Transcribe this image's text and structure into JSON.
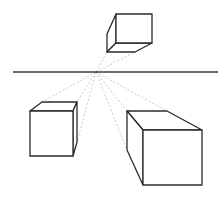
{
  "diagram": {
    "type": "one-point-perspective",
    "horizon": {
      "x1": 13,
      "x2": 218,
      "y": 72,
      "color": "#3a3a3a"
    },
    "vanishing_point": {
      "x": 96,
      "y": 72
    },
    "guide_color": "#c4c4c4",
    "edge_color": "#2b2b2b",
    "cubes": [
      {
        "name": "top-cube",
        "position": "above-horizon",
        "front_face": [
          [
            116,
            14
          ],
          [
            152,
            14
          ],
          [
            152,
            43
          ],
          [
            116,
            43
          ]
        ],
        "side_faces": [
          [
            [
              116,
              14
            ],
            [
              107,
              34
            ],
            [
              107,
              52
            ],
            [
              116,
              43
            ]
          ],
          [
            [
              116,
              43
            ],
            [
              107,
              52
            ],
            [
              135,
              52
            ],
            [
              152,
              43
            ]
          ]
        ],
        "guide_targets": [
          [
            107,
            52
          ],
          [
            135,
            52
          ]
        ]
      },
      {
        "name": "left-cube",
        "position": "below-horizon-left",
        "front_face": [
          [
            30,
            111
          ],
          [
            73,
            111
          ],
          [
            73,
            156
          ],
          [
            30,
            156
          ]
        ],
        "side_faces": [
          [
            [
              30,
              111
            ],
            [
              42,
              102
            ],
            [
              77,
              102
            ],
            [
              73,
              111
            ]
          ],
          [
            [
              73,
              111
            ],
            [
              77,
              102
            ],
            [
              77,
              142
            ],
            [
              73,
              156
            ]
          ]
        ],
        "guide_targets": [
          [
            42,
            102
          ],
          [
            77,
            102
          ],
          [
            77,
            142
          ]
        ]
      },
      {
        "name": "right-cube",
        "position": "below-horizon-right",
        "front_face": [
          [
            143,
            130
          ],
          [
            202,
            130
          ],
          [
            202,
            185
          ],
          [
            143,
            185
          ]
        ],
        "side_faces": [
          [
            [
              127,
              111
            ],
            [
              167,
              111
            ],
            [
              202,
              130
            ],
            [
              143,
              130
            ]
          ],
          [
            [
              127,
              111
            ],
            [
              143,
              130
            ],
            [
              143,
              185
            ],
            [
              127,
              150
            ]
          ]
        ],
        "guide_targets": [
          [
            127,
            111
          ],
          [
            167,
            111
          ],
          [
            127,
            150
          ]
        ]
      }
    ]
  }
}
